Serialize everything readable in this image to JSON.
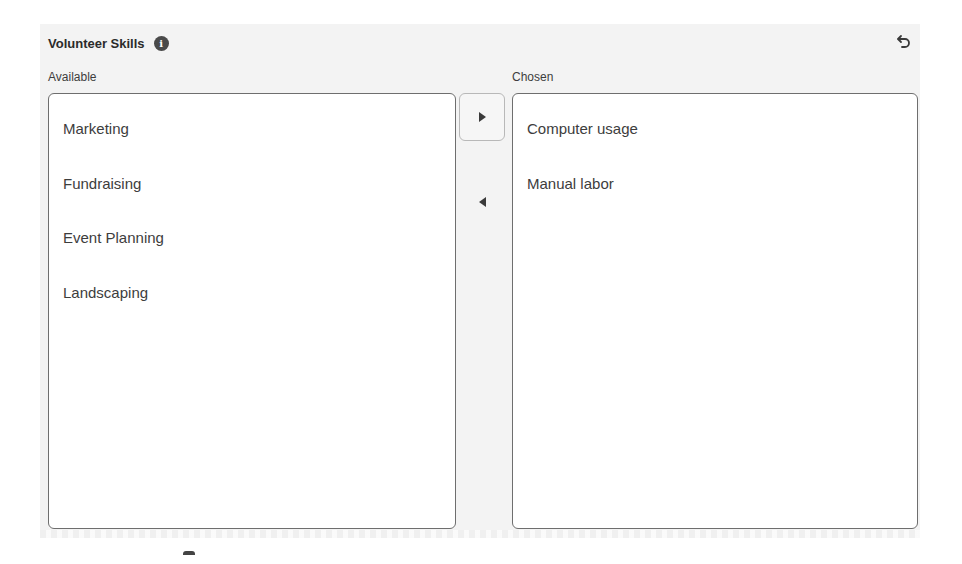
{
  "header": {
    "title": "Volunteer Skills",
    "info_icon": "info-icon",
    "info_glyph": "i",
    "undo_icon": "undo-icon"
  },
  "available": {
    "label": "Available",
    "items": [
      {
        "label": "Marketing"
      },
      {
        "label": "Fundraising"
      },
      {
        "label": "Event Planning"
      },
      {
        "label": "Landscaping"
      }
    ]
  },
  "chosen": {
    "label": "Chosen",
    "items": [
      {
        "label": "Computer usage"
      },
      {
        "label": "Manual labor"
      }
    ]
  },
  "controls": {
    "move_right_icon": "triangle-right-icon",
    "move_left_icon": "triangle-left-icon"
  },
  "colors": {
    "panel_bg": "#f3f3f3",
    "list_border": "#6e6e6e",
    "text": "#3d3d3d"
  }
}
